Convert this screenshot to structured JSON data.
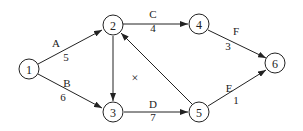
{
  "diagram": {
    "type": "activity-on-arrow network",
    "nodes": [
      {
        "id": "1",
        "label": "1",
        "x": 29,
        "y": 69
      },
      {
        "id": "2",
        "label": "2",
        "x": 113,
        "y": 25
      },
      {
        "id": "3",
        "label": "3",
        "x": 113,
        "y": 112
      },
      {
        "id": "4",
        "label": "4",
        "x": 199,
        "y": 24
      },
      {
        "id": "5",
        "label": "5",
        "x": 199,
        "y": 112
      },
      {
        "id": "6",
        "label": "6",
        "x": 275,
        "y": 63
      }
    ],
    "edges": [
      {
        "from": "1",
        "to": "2",
        "activity": "A",
        "duration": "5"
      },
      {
        "from": "1",
        "to": "3",
        "activity": "B",
        "duration": "6"
      },
      {
        "from": "2",
        "to": "4",
        "activity": "C",
        "duration": "4"
      },
      {
        "from": "3",
        "to": "5",
        "activity": "D",
        "duration": "7"
      },
      {
        "from": "5",
        "to": "6",
        "activity": "E",
        "duration": "1"
      },
      {
        "from": "4",
        "to": "6",
        "activity": "F",
        "duration": "3"
      },
      {
        "from": "2",
        "to": "3",
        "activity": "",
        "duration": ""
      },
      {
        "from": "5",
        "to": "2",
        "activity": "",
        "duration": ""
      }
    ],
    "annotations": [
      {
        "text": "×",
        "x": 135,
        "y": 78
      }
    ]
  }
}
